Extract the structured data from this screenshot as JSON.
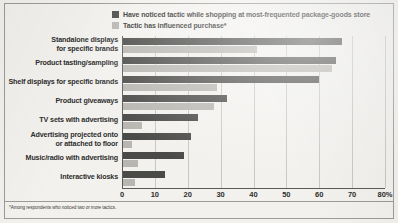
{
  "chart_data": {
    "type": "bar",
    "orientation": "horizontal",
    "title": "",
    "xlabel": "",
    "ylabel": "",
    "xlim": [
      0,
      80
    ],
    "grid": true,
    "legend_position": "top",
    "categories": [
      "Standalone displays\nfor specific brands",
      "Product tasting/sampling",
      "Shelf displays for specific brands",
      "Product giveaways",
      "TV sets with advertising",
      "Advertising projected onto\nor attached to floor",
      "Music/radio with advertising",
      "Interactive kiosks"
    ],
    "series": [
      {
        "name": "Have noticed tactic while shopping at most-frequented package-goods store",
        "color": "#4a4a48",
        "values": [
          67,
          65,
          60,
          32,
          23,
          21,
          19,
          13
        ]
      },
      {
        "name": "Tactic has influenced purchase*",
        "color": "#b7b6b1",
        "values": [
          41,
          64,
          29,
          28,
          6,
          3,
          5,
          4
        ]
      }
    ],
    "xticks": [
      0,
      10,
      20,
      30,
      40,
      50,
      60,
      70,
      80
    ],
    "xtick_labels": [
      "0",
      "10",
      "20",
      "30",
      "40",
      "50",
      "60",
      "70",
      "80%"
    ],
    "footnote": "*Among respondents who noticed two or more tactics."
  },
  "categories": [
    {
      "line1": "Standalone displays",
      "line2": "for specific brands"
    },
    {
      "line1": "Product tasting/sampling",
      "line2": ""
    },
    {
      "line1": "Shelf displays for specific brands",
      "line2": ""
    },
    {
      "line1": "Product giveaways",
      "line2": ""
    },
    {
      "line1": "TV sets with advertising",
      "line2": ""
    },
    {
      "line1": "Advertising projected onto",
      "line2": "or attached to floor"
    },
    {
      "line1": "Music/radio with advertising",
      "line2": ""
    },
    {
      "line1": "Interactive kiosks",
      "line2": ""
    }
  ],
  "legend": [
    {
      "label": "Have noticed tactic while shopping at most-frequented package-goods store",
      "color": "#4a4a48"
    },
    {
      "label": "Tactic has influenced purchase*",
      "color": "#b7b6b1"
    }
  ],
  "footnote": "*Among respondents who noticed two or more tactics."
}
